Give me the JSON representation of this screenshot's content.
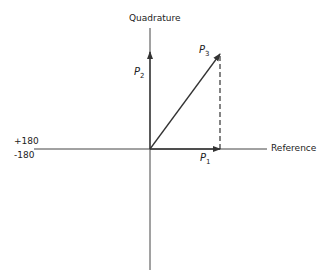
{
  "diagram": {
    "type": "phasor-diagram",
    "axes": {
      "vertical_label": "Quadrature",
      "horizontal_label": "Reference",
      "left_labels": [
        "+180",
        "-180"
      ]
    },
    "phasors": [
      {
        "name": "P",
        "sub": "1",
        "direction": "along reference"
      },
      {
        "name": "P",
        "sub": "2",
        "direction": "along quadrature"
      },
      {
        "name": "P",
        "sub": "3",
        "direction": "resultant (diagonal)"
      }
    ],
    "colors": {
      "line": "#333333",
      "background": "#ffffff"
    }
  }
}
